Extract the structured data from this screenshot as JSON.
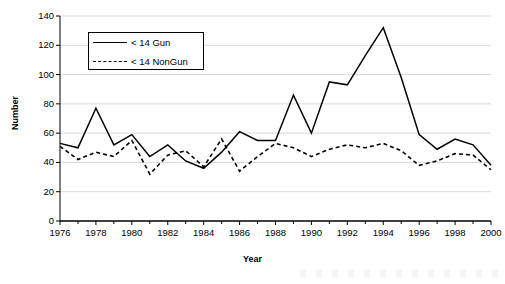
{
  "chart_data": {
    "type": "line",
    "title": "",
    "xlabel": "Year",
    "ylabel": "Number",
    "xlim": [
      1976,
      2000
    ],
    "ylim": [
      0,
      140
    ],
    "grid": true,
    "legend_position": "top-left",
    "x": [
      1976,
      1977,
      1978,
      1979,
      1980,
      1981,
      1982,
      1983,
      1984,
      1985,
      1986,
      1987,
      1988,
      1989,
      1990,
      1991,
      1992,
      1993,
      1994,
      1995,
      1996,
      1997,
      1998,
      1999,
      2000
    ],
    "xticks": [
      "1976",
      "1978",
      "1980",
      "1982",
      "1984",
      "1986",
      "1988",
      "1990",
      "1992",
      "1994",
      "1996",
      "1998",
      "2000"
    ],
    "yticks": [
      "0",
      "20",
      "40",
      "60",
      "80",
      "100",
      "120",
      "140"
    ],
    "series": [
      {
        "name": "< 14 Gun",
        "style": "solid",
        "color": "#000000",
        "values": [
          53,
          50,
          77,
          52,
          59,
          44,
          52,
          41,
          36,
          47,
          61,
          55,
          55,
          86,
          60,
          95,
          93,
          113,
          132,
          98,
          59,
          49,
          56,
          52,
          38
        ]
      },
      {
        "name": "< 14 NonGun",
        "style": "dashed",
        "color": "#000000",
        "values": [
          51,
          42,
          47,
          44,
          55,
          32,
          45,
          48,
          37,
          56,
          34,
          44,
          53,
          50,
          44,
          49,
          52,
          50,
          53,
          48,
          38,
          41,
          46,
          45,
          35
        ]
      }
    ]
  },
  "legend": {
    "items": [
      {
        "label": "< 14 Gun",
        "style": "solid"
      },
      {
        "label": "< 14 NonGun",
        "style": "dashed"
      }
    ]
  }
}
